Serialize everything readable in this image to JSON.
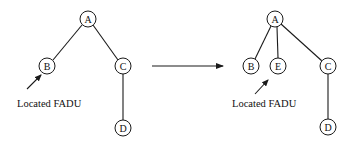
{
  "diagram": {
    "type": "tree-transformation",
    "transition_arrow": {
      "from": [
        152,
        66
      ],
      "to": [
        223,
        66
      ]
    },
    "trees": [
      {
        "id": "before",
        "nodes": [
          {
            "id": "A",
            "label": "A",
            "x": 88,
            "y": 19
          },
          {
            "id": "B",
            "label": "B",
            "x": 47,
            "y": 66
          },
          {
            "id": "C",
            "label": "C",
            "x": 123,
            "y": 66
          },
          {
            "id": "D",
            "label": "D",
            "x": 123,
            "y": 128
          }
        ],
        "edges": [
          [
            "A",
            "B"
          ],
          [
            "A",
            "C"
          ],
          [
            "C",
            "D"
          ]
        ],
        "annotation": {
          "text": "Located FADU",
          "points_to": "B",
          "text_x": 17,
          "text_y": 107,
          "arrow_from": [
            27,
            89
          ],
          "arrow_to": [
            41,
            75
          ]
        }
      },
      {
        "id": "after",
        "nodes": [
          {
            "id": "A",
            "label": "A",
            "x": 275,
            "y": 19
          },
          {
            "id": "B",
            "label": "B",
            "x": 251,
            "y": 66
          },
          {
            "id": "E",
            "label": "E",
            "x": 278,
            "y": 66
          },
          {
            "id": "C",
            "label": "C",
            "x": 328,
            "y": 66
          },
          {
            "id": "D",
            "label": "D",
            "x": 328,
            "y": 127
          }
        ],
        "edges": [
          [
            "A",
            "B"
          ],
          [
            "A",
            "E"
          ],
          [
            "A",
            "C"
          ],
          [
            "C",
            "D"
          ]
        ],
        "annotation": {
          "text": "Located FADU",
          "points_to": "E",
          "text_x": 232,
          "text_y": 107,
          "arrow_from": [
            255,
            94
          ],
          "arrow_to": [
            268,
            80
          ]
        }
      }
    ],
    "node_radius": 8
  },
  "labels": {
    "before_A": "A",
    "before_B": "B",
    "before_C": "C",
    "before_D": "D",
    "before_caption": "Located FADU",
    "after_A": "A",
    "after_B": "B",
    "after_E": "E",
    "after_C": "C",
    "after_D": "D",
    "after_caption": "Located FADU"
  }
}
